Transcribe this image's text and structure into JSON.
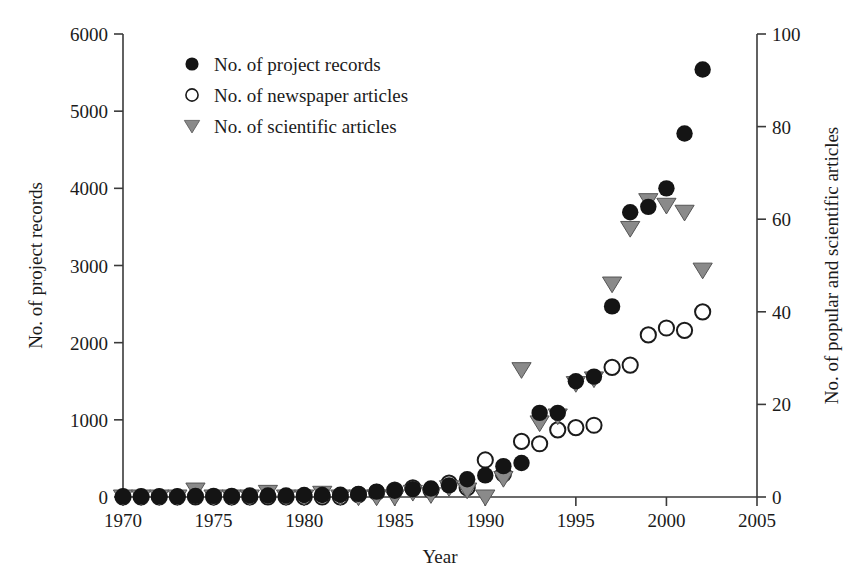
{
  "chart_data": {
    "type": "scatter",
    "title": "",
    "xlabel": "Year",
    "ylabel": "No. of project records",
    "ylabel_right": "No. of popular and scientific articles",
    "xlim": [
      1970,
      2005
    ],
    "ylim": [
      0,
      6000
    ],
    "ylim_right": [
      0,
      100
    ],
    "xticks": [
      1970,
      1975,
      1980,
      1985,
      1990,
      1995,
      2000,
      2005
    ],
    "yticks": [
      0,
      1000,
      2000,
      3000,
      4000,
      5000,
      6000
    ],
    "yticks_right": [
      0,
      20,
      40,
      60,
      80,
      100
    ],
    "grid": false,
    "legend_position": "upper-left-inside",
    "x": [
      1970,
      1971,
      1972,
      1973,
      1974,
      1975,
      1976,
      1977,
      1978,
      1979,
      1980,
      1981,
      1982,
      1983,
      1984,
      1985,
      1986,
      1987,
      1988,
      1989,
      1990,
      1991,
      1992,
      1993,
      1994,
      1995,
      1996,
      1997,
      1998,
      1999,
      2000,
      2001,
      2002
    ],
    "series": [
      {
        "name": "No. of project records",
        "marker": "filled-circle",
        "color": "#141414",
        "axis": "left",
        "values": [
          10,
          10,
          10,
          10,
          15,
          15,
          15,
          20,
          20,
          20,
          25,
          25,
          30,
          40,
          70,
          80,
          100,
          110,
          150,
          230,
          280,
          400,
          440,
          1090,
          1090,
          1500,
          1560,
          2470,
          3690,
          3760,
          4000,
          4710,
          5540
        ]
      },
      {
        "name": "No. of newspaper articles",
        "marker": "open-circle",
        "color": "#1b1b1b",
        "axis": "right",
        "values": [
          0,
          0,
          0,
          0,
          0,
          0,
          0,
          0,
          0,
          0,
          0,
          0,
          0,
          0.5,
          1,
          1.5,
          2,
          1.5,
          3,
          2,
          8,
          5,
          12,
          11.5,
          14.5,
          15,
          15.5,
          28,
          28.5,
          35,
          36.5,
          36,
          40
        ]
      },
      {
        "name": "No. of scientific articles",
        "marker": "filled-triangle-down",
        "color": "#8a8a8a",
        "axis": "right",
        "values": [
          0,
          0,
          0,
          0,
          1.5,
          0,
          0,
          0,
          1,
          0,
          0,
          0.8,
          0,
          0,
          0,
          0,
          1,
          0.5,
          2,
          1.5,
          0,
          4,
          27.5,
          16,
          17.5,
          24.5,
          25.5,
          46,
          58,
          64,
          63,
          61.5,
          49
        ]
      }
    ]
  },
  "legend": {
    "entries": [
      {
        "marker": "filled-circle",
        "label": "No. of project records"
      },
      {
        "marker": "open-circle",
        "label": "No. of newspaper articles"
      },
      {
        "marker": "filled-triangle-down",
        "label": "No. of scientific articles"
      }
    ]
  },
  "axes": {
    "x_title": "Year",
    "y_left_title": "No. of project records",
    "y_right_title": "No. of popular and scientific articles"
  }
}
